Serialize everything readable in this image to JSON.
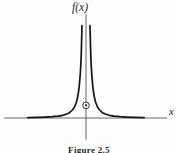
{
  "figure": {
    "y_axis_label": "f(x)",
    "x_axis_label": "x",
    "caption": "Figure 2.5",
    "ink_color": "#141414",
    "axis_color": "#555555",
    "background": "#fdfdfd"
  },
  "chart_data": {
    "type": "line",
    "title": "Figure 2.5",
    "xlabel": "x",
    "ylabel": "f(x)",
    "xlim": [
      -8.5,
      8.4
    ],
    "ylim": [
      -2.3,
      10.7
    ],
    "axes_through_origin": true,
    "grid": false,
    "legend": null,
    "series": [
      {
        "name": "f(x)",
        "branches": [
          {
            "points": [
              [
                -6,
                0.04
              ],
              [
                -5,
                0.06
              ],
              [
                -4.2,
                0.09
              ],
              [
                -3.5,
                0.13
              ],
              [
                -2.9,
                0.19
              ],
              [
                -2.4,
                0.28
              ],
              [
                -2,
                0.4
              ],
              [
                -1.7,
                0.55
              ],
              [
                -1.4,
                0.82
              ],
              [
                -1.2,
                1.11
              ],
              [
                -1,
                1.6
              ],
              [
                -0.9,
                1.98
              ],
              [
                -0.8,
                2.5
              ],
              [
                -0.7,
                3.27
              ],
              [
                -0.6,
                4.44
              ],
              [
                -0.55,
                5.29
              ],
              [
                -0.5,
                6.4
              ],
              [
                -0.45,
                7.9
              ],
              [
                -0.41,
                9.52
              ]
            ]
          },
          {
            "points": [
              [
                0.41,
                9.52
              ],
              [
                0.45,
                7.9
              ],
              [
                0.5,
                6.4
              ],
              [
                0.55,
                5.29
              ],
              [
                0.6,
                4.44
              ],
              [
                0.7,
                3.27
              ],
              [
                0.8,
                2.5
              ],
              [
                0.9,
                1.98
              ],
              [
                1,
                1.6
              ],
              [
                1.2,
                1.11
              ],
              [
                1.4,
                0.82
              ],
              [
                1.7,
                0.55
              ],
              [
                2,
                0.4
              ],
              [
                2.4,
                0.28
              ],
              [
                2.9,
                0.19
              ],
              [
                3.5,
                0.13
              ],
              [
                4.2,
                0.09
              ],
              [
                5,
                0.06
              ],
              [
                6,
                0.04
              ]
            ]
          }
        ]
      }
    ],
    "marked_point": {
      "x": 0,
      "y": 1.3,
      "style": "circled-dot"
    }
  }
}
